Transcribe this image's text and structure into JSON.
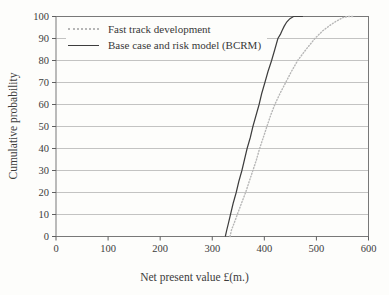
{
  "figure": {
    "x_axis_title": "Net present value £(m.)",
    "y_axis_title": "Cumulative probability"
  },
  "colors": {
    "background": "#fdfdfb",
    "gridline": "#a9a9a9",
    "plot_border": "#787878",
    "text": "#3c3c3c",
    "fast_track_line": "#b6b6b6",
    "bcrm_line": "#3d3d3d"
  },
  "chart_data": {
    "type": "line",
    "title": "",
    "xlabel": "Net present value £(m.)",
    "ylabel": "Cumulative probability",
    "xlim": [
      0,
      600
    ],
    "ylim": [
      0,
      100
    ],
    "x_ticks": [
      0,
      100,
      200,
      300,
      400,
      500,
      600
    ],
    "y_ticks": [
      0,
      10,
      20,
      30,
      40,
      50,
      60,
      70,
      80,
      90,
      100
    ],
    "grid": "horizontal-only",
    "legend_position": "top-left-inside",
    "series": [
      {
        "name": "Fast track development",
        "style": "dotted",
        "color": "#b6b6b6",
        "width": 1.4,
        "points": [
          [
            334,
            0
          ],
          [
            337,
            3
          ],
          [
            342,
            6
          ],
          [
            348,
            10
          ],
          [
            356,
            15
          ],
          [
            364,
            20
          ],
          [
            371,
            25
          ],
          [
            378,
            30
          ],
          [
            385,
            35
          ],
          [
            391,
            40
          ],
          [
            398,
            45
          ],
          [
            405,
            50
          ],
          [
            412,
            55
          ],
          [
            420,
            60
          ],
          [
            430,
            65
          ],
          [
            441,
            70
          ],
          [
            452,
            75
          ],
          [
            464,
            80
          ],
          [
            480,
            85
          ],
          [
            497,
            90
          ],
          [
            512,
            93.5
          ],
          [
            526,
            96
          ],
          [
            539,
            98
          ],
          [
            551,
            99.5
          ],
          [
            560,
            100
          ],
          [
            570,
            100
          ]
        ]
      },
      {
        "name": "Base case and risk model (BCRM)",
        "style": "solid",
        "color": "#3d3d3d",
        "width": 1.2,
        "points": [
          [
            325,
            0
          ],
          [
            328,
            3
          ],
          [
            331,
            6
          ],
          [
            335,
            10
          ],
          [
            340,
            15
          ],
          [
            346,
            20
          ],
          [
            351,
            25
          ],
          [
            357,
            30
          ],
          [
            362,
            35
          ],
          [
            367,
            40
          ],
          [
            373,
            45
          ],
          [
            378,
            50
          ],
          [
            384,
            55
          ],
          [
            390,
            60
          ],
          [
            395,
            65
          ],
          [
            401,
            70
          ],
          [
            407,
            75
          ],
          [
            414,
            80
          ],
          [
            420,
            85
          ],
          [
            426,
            90
          ],
          [
            431,
            92
          ],
          [
            434,
            93.5
          ],
          [
            438,
            95.5
          ],
          [
            443,
            97.5
          ],
          [
            449,
            99
          ],
          [
            456,
            100
          ],
          [
            474,
            100
          ]
        ]
      }
    ]
  }
}
